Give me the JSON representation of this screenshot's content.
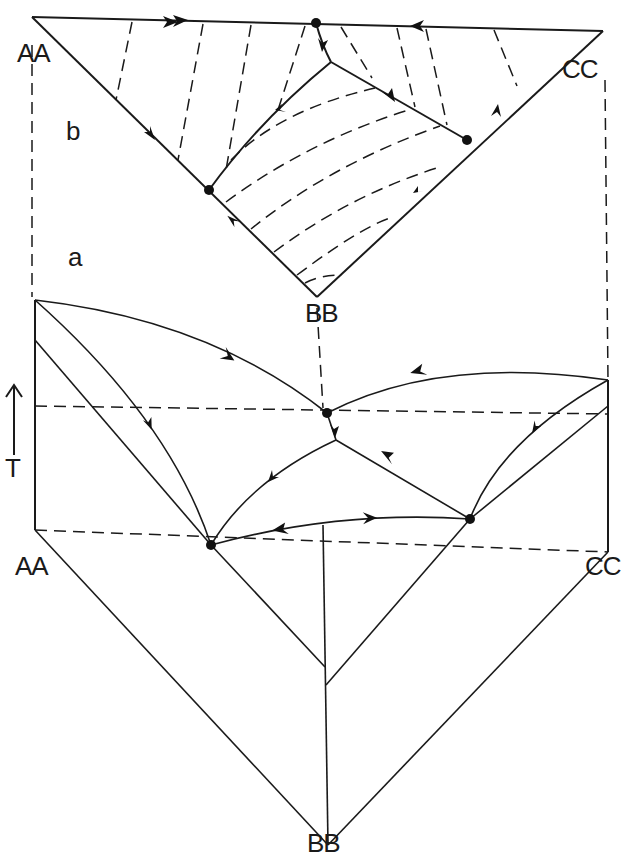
{
  "figure": {
    "panel_b": {
      "label": "b",
      "vertices": {
        "left": "AA",
        "right": "CC",
        "bottom": "BB"
      }
    },
    "panel_a": {
      "label": "a",
      "vertices": {
        "left": "AA",
        "right": "CC",
        "bottom": "BB"
      },
      "axis_label": "T",
      "axis_arrow": "↑"
    },
    "colors": {
      "ink": "#1a1a1a",
      "background": "#ffffff"
    }
  }
}
